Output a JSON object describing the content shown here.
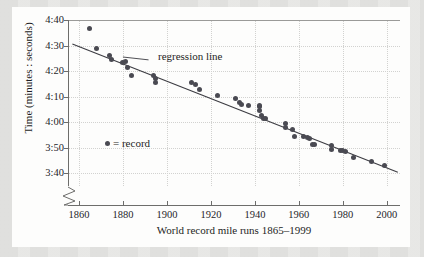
{
  "chart_data": {
    "type": "scatter",
    "title": "",
    "xlabel": "World record mile runs 1865–1999",
    "ylabel": "Time (minutes : seconds)",
    "xlim": [
      1855,
      2006
    ],
    "ylim_seconds": [
      215,
      280
    ],
    "xticks": [
      1860,
      1880,
      1900,
      1920,
      1940,
      1960,
      1980,
      2000
    ],
    "xtick_labels": [
      "1860",
      "1880",
      "1900",
      "1920",
      "1940",
      "1960",
      "1980",
      "2000"
    ],
    "yticks_seconds": [
      280,
      270,
      260,
      250,
      240,
      230,
      220
    ],
    "ytick_labels": [
      "4:40",
      "4:30",
      "4:20",
      "4:10",
      "4:00",
      "3:50",
      "3:40"
    ],
    "y_axis_break": true,
    "y_axis_break_note": "zigzag break below 3:40",
    "grid": "dotted",
    "legend": {
      "position": "inside-left",
      "entries": [
        {
          "marker": "filled-circle",
          "label": "= record"
        }
      ]
    },
    "annotations": [
      {
        "text": "regression line",
        "x": 1893,
        "y_seconds": 264,
        "leader_to_x": 1880,
        "leader_to_y_seconds": 265.5
      }
    ],
    "series": [
      {
        "name": "record",
        "marker": "filled-circle",
        "color": "#4a4a52",
        "points": [
          {
            "x": 1865,
            "y": "4:36.5",
            "y_seconds": 276.5
          },
          {
            "x": 1868,
            "y": "4:29.0",
            "y_seconds": 269.0
          },
          {
            "x": 1874,
            "y": "4:26.0",
            "y_seconds": 266.0
          },
          {
            "x": 1875,
            "y": "4:24.5",
            "y_seconds": 264.5
          },
          {
            "x": 1880,
            "y": "4:23.2",
            "y_seconds": 263.2
          },
          {
            "x": 1881,
            "y": "4:23.8",
            "y_seconds": 263.8
          },
          {
            "x": 1882,
            "y": "4:21.4",
            "y_seconds": 261.4
          },
          {
            "x": 1884,
            "y": "4:18.4",
            "y_seconds": 258.4
          },
          {
            "x": 1894,
            "y": "4:18.2",
            "y_seconds": 258.2
          },
          {
            "x": 1895,
            "y": "4:17.0",
            "y_seconds": 257.0
          },
          {
            "x": 1895,
            "y": "4:15.6",
            "y_seconds": 255.6
          },
          {
            "x": 1911,
            "y": "4:15.4",
            "y_seconds": 255.4
          },
          {
            "x": 1913,
            "y": "4:14.6",
            "y_seconds": 254.6
          },
          {
            "x": 1915,
            "y": "4:12.6",
            "y_seconds": 252.6
          },
          {
            "x": 1923,
            "y": "4:10.4",
            "y_seconds": 250.4
          },
          {
            "x": 1931,
            "y": "4:09.2",
            "y_seconds": 249.2
          },
          {
            "x": 1933,
            "y": "4:07.6",
            "y_seconds": 247.6
          },
          {
            "x": 1934,
            "y": "4:06.8",
            "y_seconds": 246.8
          },
          {
            "x": 1937,
            "y": "4:06.4",
            "y_seconds": 246.4
          },
          {
            "x": 1942,
            "y": "4:06.2",
            "y_seconds": 246.2
          },
          {
            "x": 1942,
            "y": "4:06.4",
            "y_seconds": 246.4
          },
          {
            "x": 1942,
            "y": "4:04.6",
            "y_seconds": 244.6
          },
          {
            "x": 1943,
            "y": "4:02.6",
            "y_seconds": 242.6
          },
          {
            "x": 1944,
            "y": "4:01.6",
            "y_seconds": 241.6
          },
          {
            "x": 1945,
            "y": "4:01.4",
            "y_seconds": 241.4
          },
          {
            "x": 1954,
            "y": "3:59.4",
            "y_seconds": 239.4
          },
          {
            "x": 1954,
            "y": "3:58.0",
            "y_seconds": 238.0
          },
          {
            "x": 1957,
            "y": "3:57.2",
            "y_seconds": 237.2
          },
          {
            "x": 1958,
            "y": "3:54.5",
            "y_seconds": 234.5
          },
          {
            "x": 1962,
            "y": "3:54.4",
            "y_seconds": 234.4
          },
          {
            "x": 1964,
            "y": "3:54.1",
            "y_seconds": 234.1
          },
          {
            "x": 1965,
            "y": "3:53.6",
            "y_seconds": 233.6
          },
          {
            "x": 1966,
            "y": "3:51.3",
            "y_seconds": 231.3
          },
          {
            "x": 1967,
            "y": "3:51.1",
            "y_seconds": 231.1
          },
          {
            "x": 1975,
            "y": "3:51.0",
            "y_seconds": 231.0
          },
          {
            "x": 1975,
            "y": "3:49.4",
            "y_seconds": 229.4
          },
          {
            "x": 1979,
            "y": "3:49.0",
            "y_seconds": 229.0
          },
          {
            "x": 1980,
            "y": "3:48.8",
            "y_seconds": 228.8
          },
          {
            "x": 1981,
            "y": "3:48.5",
            "y_seconds": 228.5
          },
          {
            "x": 1985,
            "y": "3:46.3",
            "y_seconds": 226.3
          },
          {
            "x": 1993,
            "y": "3:44.4",
            "y_seconds": 224.4
          },
          {
            "x": 1999,
            "y": "3:43.1",
            "y_seconds": 223.1
          }
        ]
      }
    ],
    "regression_line": {
      "label": "regression line",
      "x_start": 1857,
      "y_start_seconds": 270.6,
      "x_end": 2005,
      "y_end_seconds": 220.4,
      "color": "#3c3c42"
    }
  }
}
